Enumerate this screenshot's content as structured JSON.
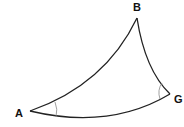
{
  "diagram": {
    "type": "curved-triangle",
    "vertices": [
      {
        "id": "A",
        "label": "A",
        "x": 30,
        "y": 111
      },
      {
        "id": "B",
        "label": "B",
        "x": 137,
        "y": 18
      },
      {
        "id": "G",
        "label": "G",
        "x": 170,
        "y": 94
      }
    ],
    "edges": [
      {
        "from": "A",
        "to": "B",
        "style": "curved"
      },
      {
        "from": "B",
        "to": "G",
        "style": "curved"
      },
      {
        "from": "G",
        "to": "A",
        "style": "curved"
      }
    ],
    "angle_marks": [
      "A",
      "G"
    ],
    "colors": {
      "stroke": "#222222",
      "angle_mark": "#888888",
      "label": "#111111"
    }
  },
  "labels": {
    "A": "A",
    "B": "B",
    "G": "G"
  }
}
